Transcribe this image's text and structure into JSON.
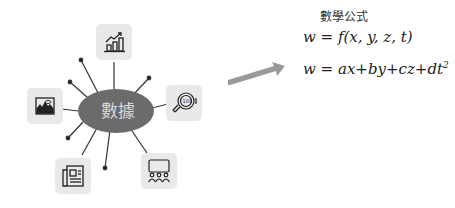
{
  "hub": {
    "label": "數據",
    "color": "#6b6b6b",
    "text_color": "#d8d8d8"
  },
  "nodes": [
    {
      "name": "chart-growth-icon",
      "position": "top"
    },
    {
      "name": "magnifier-binary-icon",
      "position": "right"
    },
    {
      "name": "image-landscape-icon",
      "position": "left"
    },
    {
      "name": "newspaper-icon",
      "position": "bottom-left"
    },
    {
      "name": "presentation-audience-icon",
      "position": "bottom-right"
    }
  ],
  "arrow": {
    "color": "#999999",
    "direction": "up-right"
  },
  "formulas": {
    "title": "數學公式",
    "eq1": "w = f(x,  y,  z,  t)",
    "eq2_main": "w = ax+by+cz+dt",
    "eq2_sup": "2"
  },
  "colors": {
    "icon_bg": "#e9e9e9",
    "line": "#333333",
    "arrow": "#999999"
  }
}
